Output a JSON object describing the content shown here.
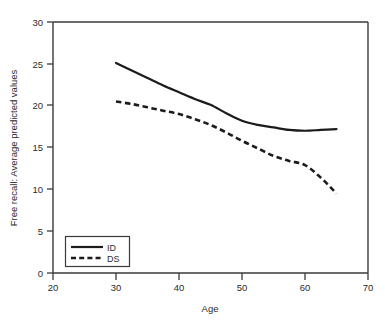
{
  "chart_data": {
    "type": "line",
    "title": "",
    "xlabel": "Age",
    "ylabel": "Free recall: Average predicted values",
    "xlim": [
      20,
      70
    ],
    "ylim": [
      0,
      30
    ],
    "xticks": [
      20,
      30,
      40,
      50,
      60,
      70
    ],
    "yticks": [
      0,
      5,
      10,
      15,
      20,
      25,
      30
    ],
    "grid": false,
    "legend_position": "lower-left",
    "series": [
      {
        "name": "ID",
        "style": "solid",
        "color": "#1b1b1b",
        "x": [
          30,
          32.5,
          35,
          37.5,
          40,
          42.5,
          45,
          47.5,
          50,
          52.5,
          55,
          57.5,
          60,
          62.5,
          65
        ],
        "values": [
          25.1,
          24.2,
          23.3,
          22.4,
          21.6,
          20.8,
          20.1,
          19.1,
          18.2,
          17.7,
          17.4,
          17.1,
          17.0,
          17.1,
          17.2
        ]
      },
      {
        "name": "DS",
        "style": "dashed",
        "color": "#1b1b1b",
        "x": [
          30,
          32.5,
          35,
          37.5,
          40,
          42.5,
          45,
          47.5,
          50,
          52.5,
          55,
          57.5,
          60,
          62.5,
          65
        ],
        "values": [
          20.5,
          20.2,
          19.8,
          19.4,
          19.0,
          18.4,
          17.7,
          16.8,
          15.8,
          14.9,
          14.0,
          13.4,
          12.9,
          11.4,
          9.5
        ]
      }
    ]
  },
  "legend": {
    "entries": [
      {
        "label": "ID"
      },
      {
        "label": "DS"
      }
    ]
  }
}
